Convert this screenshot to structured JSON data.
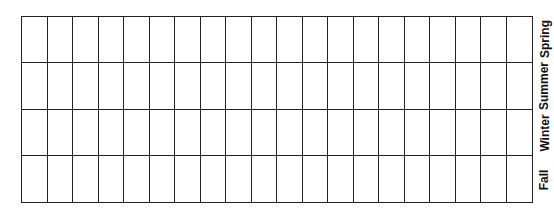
{
  "grid": {
    "columns": 20,
    "rows": 4,
    "line_color": "#222222",
    "row_labels": [
      "Spring",
      "Summer",
      "Winter",
      "Fall"
    ]
  }
}
